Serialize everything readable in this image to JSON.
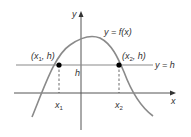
{
  "diagram": {
    "type": "function-graph",
    "colors": {
      "axes": "#555555",
      "curve": "#8a8a8a",
      "hline": "#8a8a8a",
      "points": "#000000",
      "dashed": "#444444",
      "text": "#333333"
    },
    "axes": {
      "x_label": "x",
      "y_label": "y"
    },
    "curve": {
      "label": "y = f(x)"
    },
    "horizontal_line": {
      "label": "y = h",
      "axis_label": "h"
    },
    "points": [
      {
        "label_main": "(x",
        "label_sub": "1",
        "label_tail": ", h)",
        "tick_main": "x",
        "tick_sub": "1"
      },
      {
        "label_main": "(x",
        "label_sub": "2",
        "label_tail": ", h)",
        "tick_main": "x",
        "tick_sub": "2"
      }
    ]
  }
}
